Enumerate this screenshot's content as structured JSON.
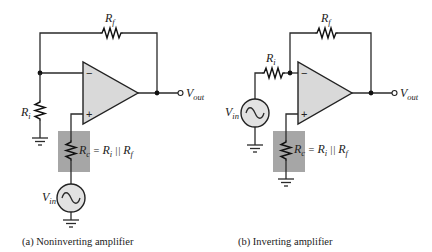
{
  "figure": {
    "panels": [
      {
        "id": "a",
        "caption": "(a) Noninverting amplifier",
        "labels": {
          "rf_main": "R",
          "rf_sub": "f",
          "ri_main": "R",
          "ri_sub": "i",
          "rc_main": "R",
          "rc_sub": "c",
          "eq_text": " = ",
          "eq_ri_main": "R",
          "eq_ri_sub": "i",
          "parallel": " || ",
          "eq_rf_main": "R",
          "eq_rf_sub": "f",
          "vin_main": "V",
          "vin_sub": "in",
          "vout_main": "V",
          "vout_sub": "out",
          "minus": "−",
          "plus": "+"
        }
      },
      {
        "id": "b",
        "caption": "(b) Inverting amplifier",
        "labels": {
          "rf_main": "R",
          "rf_sub": "f",
          "ri_main": "R",
          "ri_sub": "i",
          "rc_main": "R",
          "rc_sub": "c",
          "eq_text": " = ",
          "eq_ri_main": "R",
          "eq_ri_sub": "i",
          "parallel": " || ",
          "eq_rf_main": "R",
          "eq_rf_sub": "f",
          "vin_main": "V",
          "vin_sub": "in",
          "vout_main": "V",
          "vout_sub": "out",
          "minus": "−",
          "plus": "+"
        }
      }
    ],
    "colors": {
      "opamp_fill": "#d9d9d9",
      "shade_box": "#a6a6a6",
      "source_fill": "#e2e2e2"
    }
  }
}
